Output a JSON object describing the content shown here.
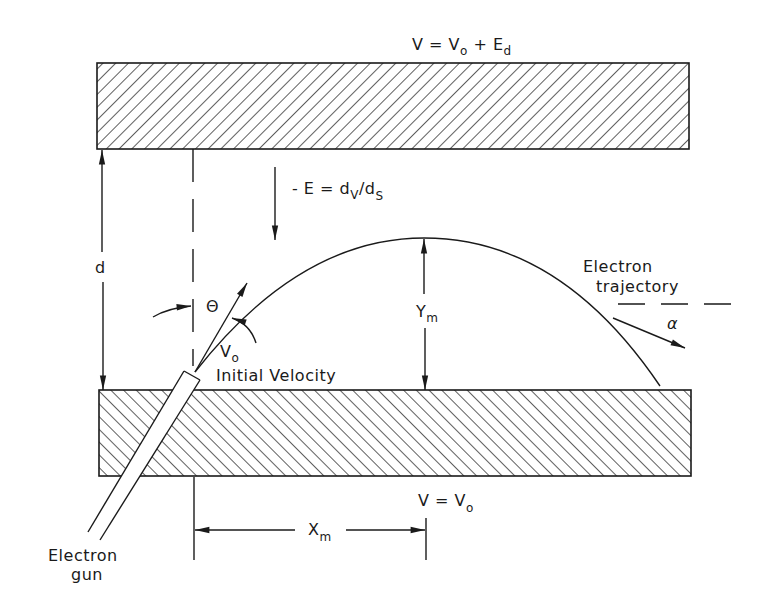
{
  "figure": {
    "colors": {
      "ink": "#1a1a1a",
      "background": "#ffffff"
    }
  },
  "top_plate": {
    "label_main": "V = V",
    "label_sub1": "o",
    "label_mid": " + E",
    "label_sub2": "d"
  },
  "bottom_plate": {
    "label_main": "V = V",
    "label_sub": "o"
  },
  "field": {
    "label_main": "- E = d",
    "label_sub1": "V",
    "label_slash": "/d",
    "label_sub2": "S"
  },
  "dimensions": {
    "gap": {
      "label": "d"
    },
    "max_height": {
      "label_main": "Y",
      "label_sub": "m"
    },
    "max_range": {
      "label_main": "X",
      "label_sub": "m"
    }
  },
  "angles": {
    "launch": {
      "label": "Θ"
    },
    "exit": {
      "label": "α"
    }
  },
  "velocity": {
    "symbol_main": "V",
    "symbol_sub": "o",
    "caption": "Initial Velocity"
  },
  "trajectory": {
    "label_line1": "Electron",
    "label_line2": "trajectory"
  },
  "gun": {
    "label_line1": "Electron",
    "label_line2": "gun"
  }
}
